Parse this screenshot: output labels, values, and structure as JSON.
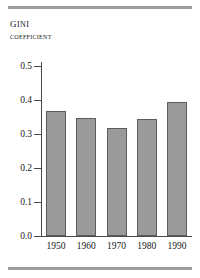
{
  "figure": {
    "title_main": "Gini",
    "title_sub": "coefficient",
    "rule_color": "#9d9d9d",
    "bar_fill": "#9a9a9a",
    "bar_stroke": "#5d5d5d",
    "axis_color": "#4a4a4a"
  },
  "chart_data": {
    "type": "bar",
    "title": "Gini coefficient",
    "xlabel": "",
    "ylabel": "Gini coefficient",
    "categories": [
      "1950",
      "1960",
      "1970",
      "1980",
      "1990"
    ],
    "values": [
      0.368,
      0.347,
      0.317,
      0.345,
      0.394
    ],
    "ylim": [
      0.0,
      0.55
    ],
    "yticks": [
      0.0,
      0.1,
      0.2,
      0.3,
      0.4,
      0.5
    ],
    "ytick_labels": [
      "0.0",
      "0.1",
      "0.2",
      "0.3",
      "0.4",
      "0.5"
    ],
    "grid": false,
    "legend": null,
    "series": [
      {
        "name": "Gini coefficient",
        "values": [
          0.368,
          0.347,
          0.317,
          0.345,
          0.394
        ]
      }
    ]
  }
}
